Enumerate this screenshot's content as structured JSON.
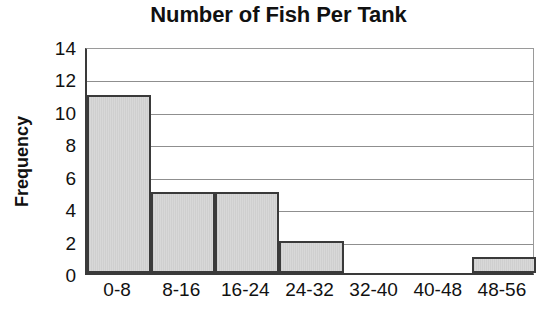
{
  "chart_data": {
    "type": "bar",
    "title": "Number of Fish Per Tank",
    "xlabel": "",
    "ylabel": "Frequency",
    "categories": [
      "0-8",
      "8-16",
      "16-24",
      "24-32",
      "32-40",
      "40-48",
      "48-56"
    ],
    "values": [
      11,
      5,
      5,
      2,
      0,
      0,
      1
    ],
    "ylim": [
      0,
      14
    ],
    "ytick_labels": [
      "0",
      "2",
      "4",
      "6",
      "8",
      "10",
      "12",
      "14"
    ],
    "ytick_values": [
      0,
      2,
      4,
      6,
      8,
      10,
      12,
      14
    ],
    "grid": "horizontal",
    "legend": "none",
    "bar_fill_color": "#d2d2d2",
    "bar_edge_color": "#3a3a3a",
    "gridline_color": "#8f8f8f",
    "axis_color": "#3a3a3a",
    "text_color": "#111111",
    "background_color": "#ffffff"
  }
}
